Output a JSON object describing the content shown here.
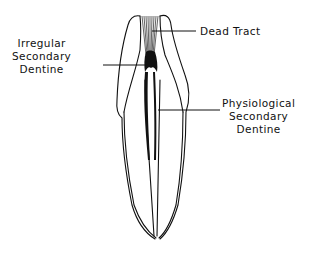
{
  "figure": {
    "labels": {
      "dead_tract": {
        "lines": [
          "Dead Tract"
        ]
      },
      "irregular_secondary_dentine": {
        "lines": [
          "Irregular",
          "Secondary",
          "Dentine"
        ]
      },
      "physiological_secondary_dentine": {
        "lines": [
          "Physiological",
          "Secondary",
          "Dentine"
        ]
      }
    },
    "colors": {
      "line": "#111111",
      "background": "#ffffff"
    }
  }
}
